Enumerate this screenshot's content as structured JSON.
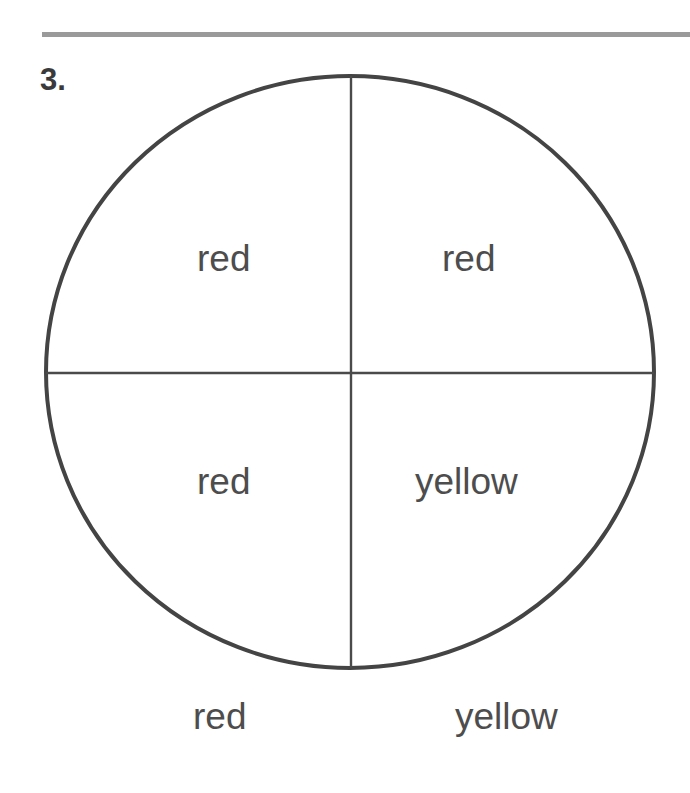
{
  "problem": {
    "number": "3."
  },
  "spinner": {
    "shape": "circle",
    "sections": [
      {
        "position": "top-left",
        "label": "red"
      },
      {
        "position": "top-right",
        "label": "red"
      },
      {
        "position": "bottom-left",
        "label": "red"
      },
      {
        "position": "bottom-right",
        "label": "yellow"
      }
    ],
    "stroke_color": "#444444"
  },
  "outcomes": [
    {
      "label": "red"
    },
    {
      "label": "yellow"
    }
  ],
  "colors": {
    "rule": "#9a9a9a",
    "text": "#4d4d4d",
    "background": "#ffffff"
  }
}
